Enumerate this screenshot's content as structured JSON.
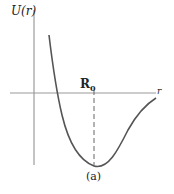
{
  "diagram": {
    "y_axis_label": "U(r)",
    "x_axis_label": "r",
    "equilibrium_label": "R",
    "equilibrium_subscript": "0",
    "caption": "(a)",
    "colors": {
      "curve": "#555555",
      "axes": "#888888",
      "text": "#222222"
    }
  }
}
